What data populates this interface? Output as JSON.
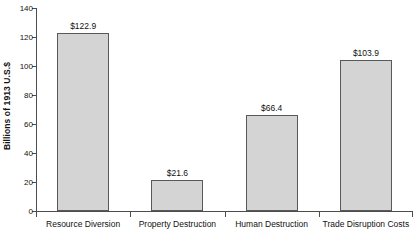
{
  "chart_data": {
    "type": "bar",
    "title": "",
    "xlabel": "",
    "ylabel": "Billions of 1913 U.S.$",
    "ylim": [
      0,
      140
    ],
    "ytick_labels": [
      "0",
      "20",
      "40",
      "60",
      "80",
      "100",
      "120",
      "140"
    ],
    "yticks": [
      0,
      20,
      40,
      60,
      80,
      100,
      120,
      140
    ],
    "grid": false,
    "legend": false,
    "categories": [
      "Resource Diversion",
      "Property Destruction",
      "Human Destruction",
      "Trade Disruption Costs"
    ],
    "values": [
      122.9,
      21.6,
      66.4,
      103.9
    ],
    "data_labels": [
      "$122.9",
      "$21.6",
      "$66.4",
      "$103.9"
    ],
    "bar_fill_color": "#d4d4d4",
    "bar_edge_color": "#595959",
    "axis_color": "#4d4d4d"
  }
}
